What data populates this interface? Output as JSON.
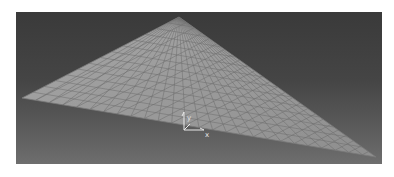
{
  "figure": {
    "viewport": {
      "background_top": "#3a3a3a",
      "background_bottom": "#6e6e6e"
    },
    "model": {
      "shape": "triangular-plate",
      "fill_color": "#9a9a9a",
      "mesh_line_color": "#6a6a6a",
      "mesh_divisions_u": 26,
      "mesh_divisions_v": 14,
      "vertices_px": [
        [
          163,
          5
        ],
        [
          6,
          86
        ],
        [
          360,
          145
        ]
      ]
    },
    "axis_triad": {
      "x_label": "x",
      "y_label": "y",
      "color": "#e8e8e8"
    }
  }
}
